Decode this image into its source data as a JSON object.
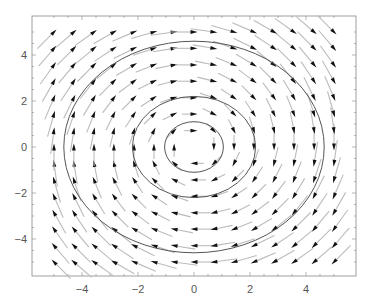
{
  "chart_data": {
    "type": "vector_field",
    "title": "",
    "xlabel": "",
    "ylabel": "",
    "xlim": [
      -5.5,
      5.5
    ],
    "ylim": [
      -5.5,
      5.5
    ],
    "x_ticks": [
      -4,
      -2,
      0,
      2,
      4
    ],
    "y_ticks": [
      -4,
      -2,
      0,
      2,
      4
    ],
    "x_tick_labels": [
      "−4",
      "−2",
      "0",
      "2",
      "4"
    ],
    "y_tick_labels": [
      "−4",
      "−2",
      "0",
      "2",
      "4"
    ],
    "grid": false,
    "legend": null,
    "field": {
      "description": "clockwise rotational field F(x,y) = (y, -x)",
      "grid_x": [
        -5,
        -4.29,
        -3.57,
        -2.86,
        -2.14,
        -1.43,
        -0.71,
        0,
        0.71,
        1.43,
        2.14,
        2.86,
        3.57,
        4.29,
        5
      ],
      "grid_y": [
        -5,
        -4.29,
        -3.57,
        -2.86,
        -2.14,
        -1.43,
        -0.71,
        0,
        0.71,
        1.43,
        2.14,
        2.86,
        3.57,
        4.29,
        5
      ],
      "direction": "clockwise"
    },
    "contours": [
      {
        "level": "inner",
        "rx": 1.05,
        "ry": 1.1
      },
      {
        "level": "middle",
        "rx": 2.2,
        "ry": 2.2
      },
      {
        "level": "outer",
        "rx": 4.65,
        "ry": 4.6
      }
    ],
    "colors": {
      "arrow_head": "#111111",
      "arrow_tail": "#bbbbbb",
      "contour": "#555555",
      "frame": "#888888",
      "tick_text": "#555555"
    }
  }
}
